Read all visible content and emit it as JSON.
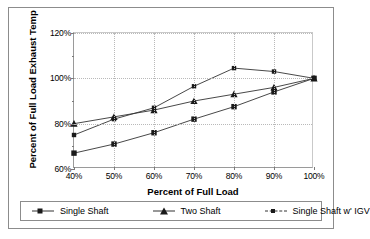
{
  "chart_data": {
    "type": "line",
    "title": "",
    "xlabel": "Percent of Full Load",
    "ylabel": "Percent of Full Load Exhaust Temp",
    "x": [
      40,
      50,
      60,
      70,
      80,
      90,
      100
    ],
    "x_tick_labels": [
      "40%",
      "50%",
      "60%",
      "70%",
      "80%",
      "90%",
      "100%"
    ],
    "y_tick_labels": [
      "60%",
      "80%",
      "100%",
      "120%"
    ],
    "y_ticks": [
      60,
      80,
      100,
      120
    ],
    "xlim": [
      40,
      100
    ],
    "ylim": [
      60,
      120
    ],
    "grid": true,
    "legend_position": "bottom",
    "series": [
      {
        "name": "Single Shaft",
        "marker": "square",
        "line": "solid",
        "values": [
          67,
          71,
          76,
          82,
          87.5,
          94,
          100
        ]
      },
      {
        "name": "Two Shaft",
        "marker": "triangle",
        "line": "solid",
        "values": [
          80,
          83,
          86,
          90,
          93,
          96,
          100
        ]
      },
      {
        "name": "Single Shaft w' IGV",
        "marker": "square-small",
        "line": "solid",
        "values": [
          75,
          82,
          87,
          96.5,
          104.5,
          103,
          100
        ]
      }
    ]
  },
  "legend": {
    "items": [
      {
        "label": "Single Shaft",
        "key": "square-marker-icon"
      },
      {
        "label": "Two Shaft",
        "key": "triangle-marker-icon"
      },
      {
        "label": "Single Shaft w' IGV",
        "key": "square-small-marker-icon"
      }
    ]
  },
  "colors": {
    "series_line": "#333333",
    "marker": "#1a1a1a",
    "grid": "#b9b9b9",
    "axis": "#9a9a9a",
    "frame": "#8c8c8c",
    "background": "#ffffff"
  }
}
